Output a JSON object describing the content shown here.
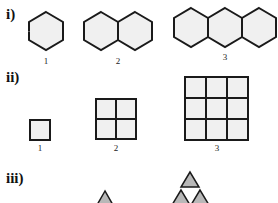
{
  "sections": [
    {
      "label": "i)",
      "shape": "hexagon",
      "figures": [
        {
          "index": "1",
          "count": 1
        },
        {
          "index": "2",
          "count": 2
        },
        {
          "index": "3",
          "count": 3
        }
      ]
    },
    {
      "label": "ii)",
      "shape": "square",
      "figures": [
        {
          "index": "1",
          "grid": "1x1"
        },
        {
          "index": "2",
          "grid": "2x2"
        },
        {
          "index": "3",
          "grid": "3x3"
        }
      ]
    },
    {
      "label": "iii)",
      "shape": "triangle",
      "figures": [
        {
          "index": "1",
          "count": 0
        },
        {
          "index": "2",
          "count": 1
        },
        {
          "index": "3",
          "count": 3
        }
      ]
    }
  ],
  "colors": {
    "stroke": "#1a1a1a",
    "fill": "#f0f0f0",
    "triangle_fill": "#b8b8b8"
  }
}
